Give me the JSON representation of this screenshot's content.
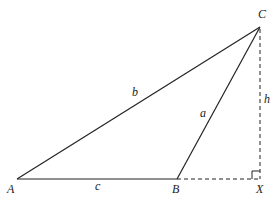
{
  "diagram": {
    "type": "triangle-with-altitude",
    "colors": {
      "stroke": "#222222",
      "background": "#ffffff"
    },
    "points": {
      "A": {
        "label": "A",
        "x": 17,
        "y": 179,
        "label_x": 7,
        "label_y": 193
      },
      "B": {
        "label": "B",
        "x": 177,
        "y": 179,
        "label_x": 172,
        "label_y": 193
      },
      "C": {
        "label": "C",
        "x": 260,
        "y": 27,
        "label_x": 258,
        "label_y": 18
      },
      "X": {
        "label": "X",
        "x": 260,
        "y": 179,
        "label_x": 256,
        "label_y": 193
      }
    },
    "sides": {
      "a": {
        "label": "a",
        "from": "B",
        "to": "C",
        "label_x": 200,
        "label_y": 117,
        "style": "solid"
      },
      "b": {
        "label": "b",
        "from": "A",
        "to": "C",
        "label_x": 132,
        "label_y": 96,
        "style": "solid"
      },
      "c": {
        "label": "c",
        "from": "A",
        "to": "B",
        "label_x": 95,
        "label_y": 190,
        "style": "solid"
      }
    },
    "auxiliary": {
      "h": {
        "label": "h",
        "from": "C",
        "to": "X",
        "label_x": 264,
        "label_y": 103,
        "style": "dashed"
      },
      "extension": {
        "label": "",
        "from": "B",
        "to": "X",
        "style": "dashed"
      },
      "right_angle_at": "X"
    }
  }
}
